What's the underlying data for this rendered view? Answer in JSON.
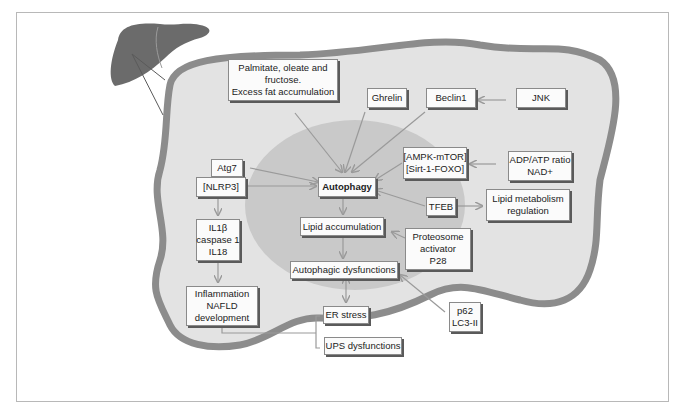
{
  "diagram": {
    "colors": {
      "liver": "#6b6b6b",
      "cell_fill": "#e3e3e3",
      "cell_border": "#8c8c8c",
      "nucleus_fill": "#c9c9c9",
      "arrow": "#9a9a9a",
      "box_fill": "#fbfbfb"
    },
    "nodes": {
      "palmitate": {
        "lines": [
          "Palmitate, oleate and",
          "fructose.",
          "Excess fat accumulation"
        ]
      },
      "ghrelin": {
        "lines": [
          "Ghrelin"
        ]
      },
      "beclin1": {
        "lines": [
          "Beclin1"
        ]
      },
      "jnk": {
        "lines": [
          "JNK"
        ]
      },
      "atg7": {
        "lines": [
          "Atg7"
        ]
      },
      "nlrp3": {
        "lines": [
          "[NLRP3]"
        ]
      },
      "autophagy": {
        "lines": [
          "Autophagy"
        ]
      },
      "ampk": {
        "lines": [
          "[AMPK-mTOR]",
          "[Sirt-1-FOXO]"
        ]
      },
      "adp_atp": {
        "lines": [
          "ADP/ATP ratio",
          "NAD+"
        ]
      },
      "tfeb": {
        "lines": [
          "TFEB"
        ]
      },
      "lipid_metabolism": {
        "lines": [
          "Lipid metabolism",
          "regulation"
        ]
      },
      "il1b": {
        "lines": [
          "IL1β",
          "caspase 1",
          "IL18"
        ]
      },
      "lipid_accumulation": {
        "lines": [
          "Lipid accumulation"
        ]
      },
      "proteosome": {
        "lines": [
          "Proteosome",
          "activator",
          "P28"
        ]
      },
      "autophagic_dysfunctions": {
        "lines": [
          "Autophagic dysfunctions"
        ]
      },
      "inflammation": {
        "lines": [
          "Inflammation",
          "NAFLD",
          "development"
        ]
      },
      "er_stress": {
        "lines": [
          "ER stress"
        ]
      },
      "ups": {
        "lines": [
          "UPS dysfunctions"
        ]
      },
      "p62": {
        "lines": [
          "p62",
          "LC3-II"
        ]
      }
    },
    "edges": [
      {
        "from": "palmitate",
        "to": "autophagy"
      },
      {
        "from": "ghrelin",
        "to": "autophagy"
      },
      {
        "from": "beclin1",
        "to": "autophagy"
      },
      {
        "from": "jnk",
        "to": "beclin1"
      },
      {
        "from": "atg7",
        "to": "autophagy"
      },
      {
        "from": "nlrp3",
        "to": "autophagy"
      },
      {
        "from": "ampk",
        "to": "autophagy"
      },
      {
        "from": "adp_atp",
        "to": "ampk"
      },
      {
        "from": "tfeb",
        "to": "autophagy"
      },
      {
        "from": "tfeb",
        "to": "lipid_metabolism"
      },
      {
        "from": "nlrp3",
        "to": "il1b"
      },
      {
        "from": "il1b",
        "to": "inflammation"
      },
      {
        "from": "autophagy",
        "to": "lipid_accumulation"
      },
      {
        "from": "proteosome",
        "to": "lipid_accumulation"
      },
      {
        "from": "lipid_accumulation",
        "to": "autophagic_dysfunctions"
      },
      {
        "from": "autophagic_dysfunctions",
        "to": "er_stress",
        "bidirectional": true
      },
      {
        "from": "p62",
        "to": "autophagic_dysfunctions"
      },
      {
        "from": "inflammation",
        "to": "er_stress",
        "bracket": true
      },
      {
        "from": "inflammation",
        "to": "ups",
        "bracket": true
      }
    ]
  }
}
